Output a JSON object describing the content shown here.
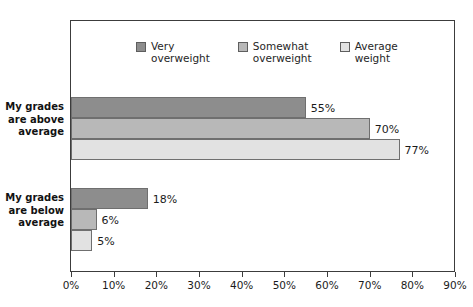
{
  "chart_data": {
    "type": "bar",
    "orientation": "horizontal",
    "title": "",
    "xlabel": "",
    "ylabel": "",
    "xlim": [
      0,
      90
    ],
    "xtick_labels": [
      "0%",
      "10%",
      "20%",
      "30%",
      "40%",
      "50%",
      "60%",
      "70%",
      "80%",
      "90%"
    ],
    "xticks": [
      0,
      10,
      20,
      30,
      40,
      50,
      60,
      70,
      80,
      90
    ],
    "grid": false,
    "legend_position": "top-center",
    "categories": [
      "My grades\nare above\naverage",
      "My grades\nare below\naverage"
    ],
    "series": [
      {
        "name": "Very\noverweight",
        "legend_label": "Very\noverweight",
        "color": "#8d8d8d",
        "values": [
          55,
          18
        ],
        "labels": [
          "55%",
          "18%"
        ]
      },
      {
        "name": "Somewhat\noverweight",
        "legend_label": "Somewhat\noverweight",
        "color": "#b8b8b8",
        "values": [
          70,
          6
        ],
        "labels": [
          "70%",
          "6%"
        ]
      },
      {
        "name": "Average\nweight",
        "legend_label": "Average\nweight",
        "color": "#e2e2e2",
        "values": [
          77,
          5
        ],
        "labels": [
          "77%",
          "5%"
        ]
      }
    ]
  },
  "legend": {
    "items": [
      {
        "label": "Very\noverweight",
        "color": "#8d8d8d"
      },
      {
        "label": "Somewhat\noverweight",
        "color": "#b8b8b8"
      },
      {
        "label": "Average\nweight",
        "color": "#e2e2e2"
      }
    ]
  },
  "axis": {
    "ticks": [
      {
        "label": "0%",
        "value": 0
      },
      {
        "label": "10%",
        "value": 10
      },
      {
        "label": "20%",
        "value": 20
      },
      {
        "label": "30%",
        "value": 30
      },
      {
        "label": "40%",
        "value": 40
      },
      {
        "label": "50%",
        "value": 50
      },
      {
        "label": "60%",
        "value": 60
      },
      {
        "label": "70%",
        "value": 70
      },
      {
        "label": "80%",
        "value": 80
      },
      {
        "label": "90%",
        "value": 90
      }
    ]
  },
  "groups": [
    {
      "label": "My grades\nare above\naverage",
      "bars": [
        {
          "series": "Very overweight",
          "value": 55,
          "label": "55%",
          "color": "#8d8d8d"
        },
        {
          "series": "Somewhat overweight",
          "value": 70,
          "label": "70%",
          "color": "#b8b8b8"
        },
        {
          "series": "Average weight",
          "value": 77,
          "label": "77%",
          "color": "#e2e2e2"
        }
      ]
    },
    {
      "label": "My grades\nare below\naverage",
      "bars": [
        {
          "series": "Very overweight",
          "value": 18,
          "label": "18%",
          "color": "#8d8d8d"
        },
        {
          "series": "Somewhat overweight",
          "value": 6,
          "label": "6%",
          "color": "#b8b8b8"
        },
        {
          "series": "Average weight",
          "value": 5,
          "label": "5%",
          "color": "#e2e2e2"
        }
      ]
    }
  ],
  "title_sliver": ""
}
